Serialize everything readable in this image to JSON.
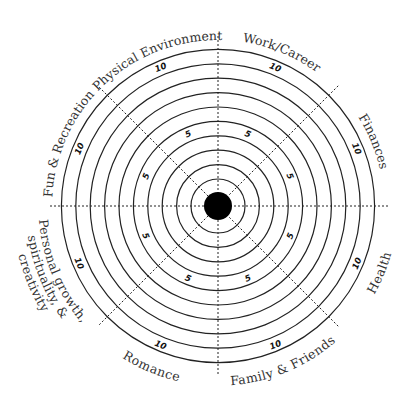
{
  "diagram": {
    "center": {
      "x": 218,
      "y": 206
    },
    "hub_radius": 14,
    "ring_count": 10,
    "ring_inner_radius": 27,
    "ring_step": 14.4,
    "spoke_length": 170,
    "colors": {
      "line": "#222222",
      "hub": "#000000",
      "label": "#333333"
    },
    "scale_marks": [
      {
        "value": "5",
        "ring": 5
      },
      {
        "value": "10",
        "ring": 10
      }
    ],
    "sectors": [
      {
        "label": "Work/Career",
        "angle": 22.5
      },
      {
        "label": "Finances",
        "angle": 67.5
      },
      {
        "label": "Health",
        "angle": 112.5
      },
      {
        "label": "Family & Friends",
        "angle": 157.5
      },
      {
        "label": "Romance",
        "angle": 202.5
      },
      {
        "label": "Personal growth, spirituality, & creativity",
        "angle": 247.5,
        "lines": [
          "Personal growth,",
          "spirituality, &",
          "creativity"
        ]
      },
      {
        "label": "Fun & Recreation",
        "angle": 292.5
      },
      {
        "label": "Physical Environment",
        "angle": 337.5
      }
    ]
  }
}
